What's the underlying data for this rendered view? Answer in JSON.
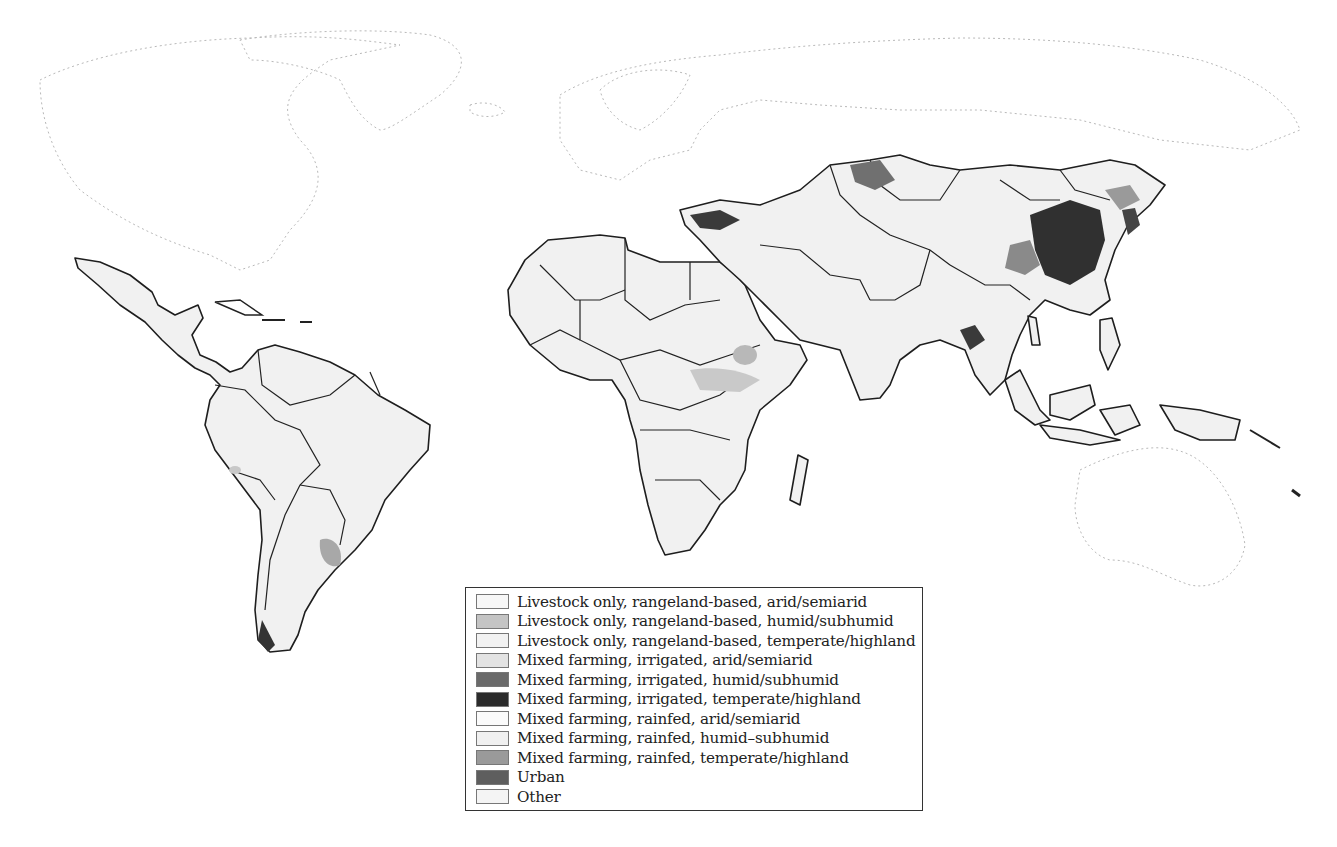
{
  "map": {
    "title": "",
    "projection": "world, equirectangular-like",
    "highlighted_regions": [
      "Latin America",
      "Africa",
      "Middle East",
      "Central Asia",
      "South Asia",
      "East Asia",
      "Southeast Asia"
    ],
    "faint_regions": [
      "North America",
      "Greenland",
      "Europe",
      "Russia",
      "Australia"
    ]
  },
  "legend": {
    "items": [
      {
        "label": "Livestock only, rangeland-based, arid/semiarid",
        "color": "#f7f7f7"
      },
      {
        "label": "Livestock only, rangeland-based, humid/subhumid",
        "color": "#c4c4c4"
      },
      {
        "label": "Livestock only, rangeland-based, temperate/highland",
        "color": "#f2f2f2"
      },
      {
        "label": "Mixed farming, irrigated, arid/semiarid",
        "color": "#e3e3e3"
      },
      {
        "label": "Mixed farming, irrigated, humid/subhumid",
        "color": "#6a6a6a"
      },
      {
        "label": "Mixed farming, irrigated, temperate/highland",
        "color": "#2b2b2b"
      },
      {
        "label": "Mixed farming, rainfed, arid/semiarid",
        "color": "#fbfbfb"
      },
      {
        "label": "Mixed farming, rainfed, humid–subhumid",
        "color": "#f0f0f0"
      },
      {
        "label": "Mixed farming, rainfed, temperate/highland",
        "color": "#9a9a9a"
      },
      {
        "label": "Urban",
        "color": "#5e5e5e"
      },
      {
        "label": "Other",
        "color": "#f4f4f4"
      }
    ]
  }
}
